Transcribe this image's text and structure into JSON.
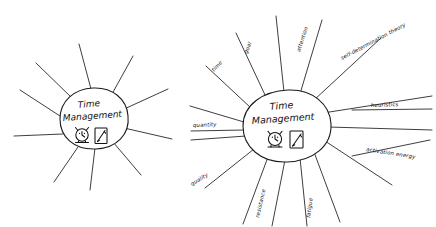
{
  "page": {
    "background_color": "#ffffff",
    "ink_color": "#141414",
    "width": 436,
    "height": 227
  },
  "diagrams": [
    {
      "id": "left-sun",
      "name": "blank-sun-diagram",
      "center": {
        "line1": "Time",
        "line2": "Management"
      },
      "icons": [
        {
          "name": "alarm-clock-icon",
          "label": "alarm clock"
        },
        {
          "name": "notepad-pencil-icon",
          "label": "notepad with pencil"
        }
      ],
      "ray_count": 10,
      "labels": []
    },
    {
      "id": "right-sun",
      "name": "labeled-sun-diagram",
      "center": {
        "line1": "Time",
        "line2": "Management"
      },
      "icons": [
        {
          "name": "alarm-clock-icon",
          "label": "alarm clock"
        },
        {
          "name": "notepad-pencil-icon",
          "label": "notepad with pencil"
        }
      ],
      "ray_count": 14,
      "labels": [
        {
          "text": "time",
          "position": "upper-left"
        },
        {
          "text": "goal",
          "position": "top-left"
        },
        {
          "text": "attention",
          "position": "top-right"
        },
        {
          "text": "self-determination theory",
          "position": "upper-right"
        },
        {
          "text": "heuristics",
          "position": "right"
        },
        {
          "text": "activation energy",
          "position": "lower-right"
        },
        {
          "text": "quantity",
          "position": "left"
        },
        {
          "text": "quality",
          "position": "lower-left"
        },
        {
          "text": "resistance",
          "position": "bottom-left"
        },
        {
          "text": "fatigue",
          "position": "bottom-right"
        }
      ]
    }
  ],
  "top_fragment": {
    "text": ""
  }
}
